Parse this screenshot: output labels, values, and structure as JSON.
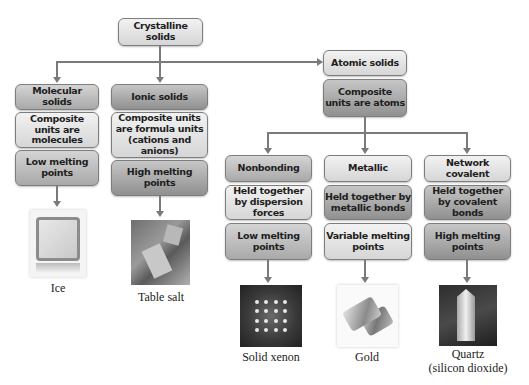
{
  "root": {
    "label": "Crystalline solids"
  },
  "categories": [
    {
      "name": "Molecular solids",
      "composite": "Composite units are molecules",
      "melting": "Low melting points",
      "example": {
        "label": "Ice",
        "image": "ice-cube"
      }
    },
    {
      "name": "Ionic solids",
      "composite": "Composite units are formula units (cations and anions)",
      "melting": "High melting points",
      "example": {
        "label": "Table salt",
        "image": "salt-crystals"
      }
    },
    {
      "name": "Atomic solids",
      "composite": "Composite units are atoms",
      "subtypes": [
        {
          "name": "Nonbonding",
          "bonding": "Held together by dispersion forces",
          "melting": "Low melting points",
          "example": {
            "label": "Solid xenon",
            "image": "xenon-lattice"
          }
        },
        {
          "name": "Metallic",
          "bonding": "Held together by metallic bonds",
          "melting": "Variable melting points",
          "example": {
            "label": "Gold",
            "image": "gold-bars"
          }
        },
        {
          "name": "Network covalent",
          "bonding": "Held together by covalent bonds",
          "melting": "High melting points",
          "example": {
            "label": "Quartz",
            "sublabel": "(silicon dioxide)",
            "image": "quartz-crystal"
          }
        }
      ]
    }
  ]
}
